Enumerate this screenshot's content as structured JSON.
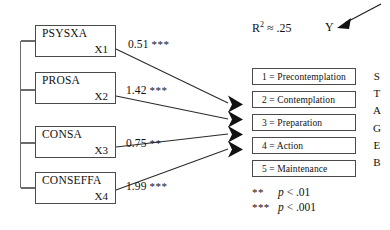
{
  "diagram": {
    "predictors": [
      {
        "name": "PSYSXA",
        "code": "X1",
        "coefficient": "0.51",
        "stars": "***"
      },
      {
        "name": "PROSA",
        "code": "X2",
        "coefficient": "1.42",
        "stars": "***"
      },
      {
        "name": "CONSA",
        "code": "X3",
        "coefficient": "0.75",
        "stars": "**"
      },
      {
        "name": "CONSEFFA",
        "code": "X4",
        "coefficient": "1.99",
        "stars": "***"
      }
    ],
    "outcome": {
      "r_squared_label": "R",
      "r_squared_exponent": "2",
      "r_squared_value": "≈ .25",
      "variable_label": "Y",
      "vertical_label": [
        "S",
        "T",
        "A",
        "G",
        "E",
        "B"
      ]
    },
    "stages": [
      {
        "text": "1 = Precontemplation"
      },
      {
        "text": "2 = Contemplation"
      },
      {
        "text": "3 = Preparation"
      },
      {
        "text": "4 = Action"
      },
      {
        "text": "5 = Maintenance"
      }
    ],
    "legend": [
      {
        "stars": "**",
        "p_prefix": "p",
        "p_text": " < .01"
      },
      {
        "stars": "***",
        "p_prefix": "p",
        "p_text": " < .001"
      }
    ],
    "colors": {
      "stroke": "#4a4a4a",
      "arrow": "#111111",
      "background": "#ffffff"
    }
  }
}
